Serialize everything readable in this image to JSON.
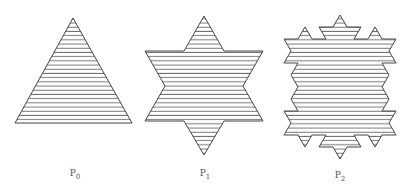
{
  "figures": [
    {
      "id": "p0",
      "name": "P",
      "subscript": "0",
      "shape": "triangle",
      "label_x": 75,
      "label_y": 168
    },
    {
      "id": "p1",
      "name": "P",
      "subscript": "1",
      "shape": "hexagram",
      "label_x": 205,
      "label_y": 168
    },
    {
      "id": "p2",
      "name": "P",
      "subscript": "2",
      "shape": "koch-snowflake-iteration-2",
      "label_x": 340,
      "label_y": 170
    }
  ],
  "style": {
    "stroke": "#444444",
    "hatch": "#555555",
    "background": "#ffffff"
  }
}
